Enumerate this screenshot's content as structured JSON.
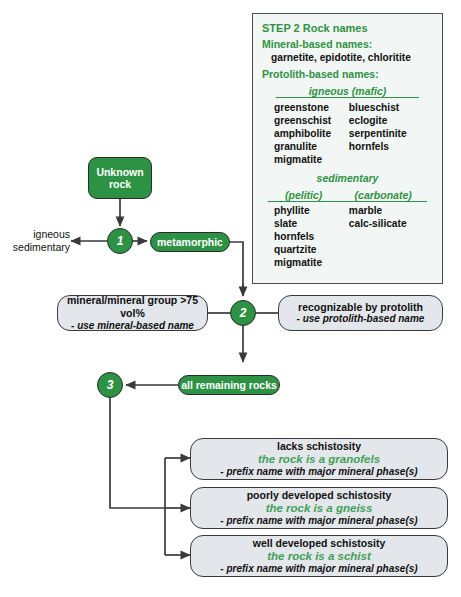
{
  "diagram": {
    "accent_green": "#2e9245",
    "box_fill": "#e3e6ea",
    "legend_fill": "#f2f6f4"
  },
  "nodes": {
    "unknown_rock": "Unknown\nrock",
    "unknown_rock_line1": "Unknown",
    "unknown_rock_line2": "rock",
    "step1_number": "1",
    "step2_number": "2",
    "step3_number": "3",
    "metamorphic": "metamorphic",
    "all_remaining_rocks": "all remaining rocks",
    "left_branch_line1": "igneous",
    "left_branch_line2": "sedimentary"
  },
  "step2_options": {
    "left": {
      "line1": "mineral/mineral group >75 vol%",
      "line2": "- use mineral-based name"
    },
    "right": {
      "line1": "recognizable by protolith",
      "line2": "- use protolith-based name"
    }
  },
  "step3_options": [
    {
      "line1": "lacks schistosity",
      "line2": "the rock is a granofels",
      "line3": "- prefix name with major mineral phase(s)"
    },
    {
      "line1": "poorly developed schistosity",
      "line2": "the rock is a gneiss",
      "line3": "- prefix name with major mineral phase(s)"
    },
    {
      "line1": "well developed schistosity",
      "line2": "the rock is a schist",
      "line3": "- prefix name with major mineral phase(s)"
    }
  ],
  "legend": {
    "header": "STEP 2 Rock names",
    "mineral_based_heading": "Mineral-based names:",
    "mineral_based_names": "garnetite, epidotite, chloritite",
    "protolith_based_heading": "Protolith-based names:",
    "igneous_category": "igneous (mafic)",
    "igneous_col_a": [
      "greenstone",
      "greenschist",
      "amphibolite",
      "granulite",
      "migmatite"
    ],
    "igneous_col_b": [
      "blueschist",
      "eclogite",
      "serpentinite",
      "hornfels"
    ],
    "sedimentary_category": "sedimentary",
    "sedimentary_sub_left": "(pelitic)",
    "sedimentary_sub_right": "(carbonate)",
    "sedimentary_col_a": [
      "phyllite",
      "slate",
      "hornfels",
      "quartzite",
      "migmatite"
    ],
    "sedimentary_col_b": [
      "marble",
      "calc-silicate"
    ]
  }
}
